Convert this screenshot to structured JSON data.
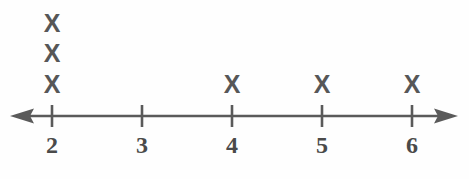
{
  "figure": {
    "kind": "dot-plot",
    "background_color": "#fefefe",
    "mark_color": "#575757",
    "axis_color": "#5a5a5a",
    "label_color": "#4a4a4a",
    "width": 469,
    "height": 179
  },
  "axis": {
    "line_y": 116,
    "left_arrow_tip_x": 10,
    "right_arrow_tip_x": 458,
    "tick_top_y": 105,
    "tick_bottom_y": 127,
    "label_y": 145,
    "tick_positions_px": [
      52,
      142,
      232,
      322,
      412
    ],
    "tick_labels": [
      "2",
      "3",
      "4",
      "5",
      "6"
    ]
  },
  "marks": {
    "glyph": "X",
    "row_y_px": [
      23,
      53,
      84
    ],
    "stacks": [
      {
        "value": "2",
        "x_px": 52,
        "count": 3
      },
      {
        "value": "3",
        "x_px": 142,
        "count": 0
      },
      {
        "value": "4",
        "x_px": 232,
        "count": 1
      },
      {
        "value": "5",
        "x_px": 322,
        "count": 1
      },
      {
        "value": "6",
        "x_px": 412,
        "count": 1
      }
    ]
  },
  "chart_data": {
    "type": "scatter",
    "subtype": "dot-plot",
    "title": "",
    "subtitle": "",
    "xlabel": "",
    "ylabel": "",
    "categories": [
      "2",
      "3",
      "4",
      "5",
      "6"
    ],
    "x": [
      2,
      3,
      4,
      5,
      6
    ],
    "values": [
      3,
      0,
      1,
      1,
      1
    ],
    "counts": {
      "2": 3,
      "3": 0,
      "4": 1,
      "5": 1,
      "6": 1
    },
    "data_points": [
      2,
      2,
      2,
      4,
      5,
      6
    ],
    "marker": "X",
    "xlim": [
      1.53,
      6.51
    ],
    "ylim": [
      0,
      3
    ],
    "grid": false,
    "legend": null,
    "annotations": [],
    "axis_arrows": "both",
    "tick_labels": [
      "2",
      "3",
      "4",
      "5",
      "6"
    ],
    "total_count": 6
  }
}
